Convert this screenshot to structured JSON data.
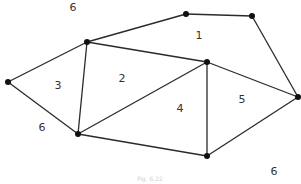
{
  "diagram": {
    "type": "planar-graph",
    "caption": "Fig. 6.22",
    "nodes": [
      {
        "id": "A",
        "x": 8,
        "y": 82
      },
      {
        "id": "B",
        "x": 87,
        "y": 42
      },
      {
        "id": "C",
        "x": 186,
        "y": 14
      },
      {
        "id": "D",
        "x": 252,
        "y": 16
      },
      {
        "id": "E",
        "x": 298,
        "y": 97
      },
      {
        "id": "F",
        "x": 207,
        "y": 62
      },
      {
        "id": "G",
        "x": 78,
        "y": 134
      },
      {
        "id": "H",
        "x": 207,
        "y": 156
      }
    ],
    "edges": [
      [
        "A",
        "B"
      ],
      [
        "A",
        "G"
      ],
      [
        "B",
        "C"
      ],
      [
        "C",
        "D"
      ],
      [
        "D",
        "E"
      ],
      [
        "B",
        "F"
      ],
      [
        "B",
        "G"
      ],
      [
        "G",
        "F"
      ],
      [
        "F",
        "H"
      ],
      [
        "F",
        "E"
      ],
      [
        "G",
        "H"
      ],
      [
        "H",
        "E"
      ]
    ],
    "regions": [
      {
        "label": "1",
        "x": 199,
        "y": 35
      },
      {
        "label": "2",
        "x": 122,
        "y": 78
      },
      {
        "label": "3",
        "x": 58,
        "y": 85
      },
      {
        "label": "4",
        "x": 180,
        "y": 108
      },
      {
        "label": "5",
        "x": 242,
        "y": 99
      },
      {
        "label": "6",
        "x": 73,
        "y": 7
      },
      {
        "label": "6",
        "x": 42,
        "y": 127
      },
      {
        "label": "6",
        "x": 274,
        "y": 171
      }
    ],
    "colors": {
      "edge": "#2a2a2a",
      "node": "#111111",
      "label": "#333333"
    }
  }
}
